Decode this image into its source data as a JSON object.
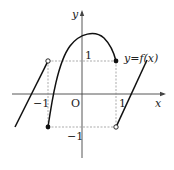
{
  "diagram": {
    "type": "function-graph",
    "function_label": "y=f(x)",
    "axes": {
      "x_label": "x",
      "y_label": "y",
      "origin_label": "O"
    },
    "tick_labels": {
      "x_neg1": "−1",
      "x_pos1": "1",
      "y_pos1": "1",
      "y_neg1": "−1"
    },
    "key_points": [
      {
        "x": -1,
        "y": 1,
        "style": "open"
      },
      {
        "x": -1,
        "y": -1,
        "style": "filled"
      },
      {
        "x": 1,
        "y": 1,
        "style": "filled"
      },
      {
        "x": 1,
        "y": -1,
        "style": "open"
      }
    ],
    "pieces": [
      {
        "domain": "x < -1",
        "shape": "line",
        "description": "increasing line ending at open circle (-1, 1)"
      },
      {
        "domain": "-1 <= x <= 1",
        "shape": "downward parabola",
        "description": "from filled (-1,-1) rising to a maximum near x≈0.3 then down to filled (1,1)"
      },
      {
        "domain": "x > 1",
        "shape": "line",
        "description": "increasing line starting at open circle (1,-1)"
      }
    ],
    "colors": {
      "curve": "#111111",
      "axis": "#444444",
      "guide": "#888888"
    }
  }
}
